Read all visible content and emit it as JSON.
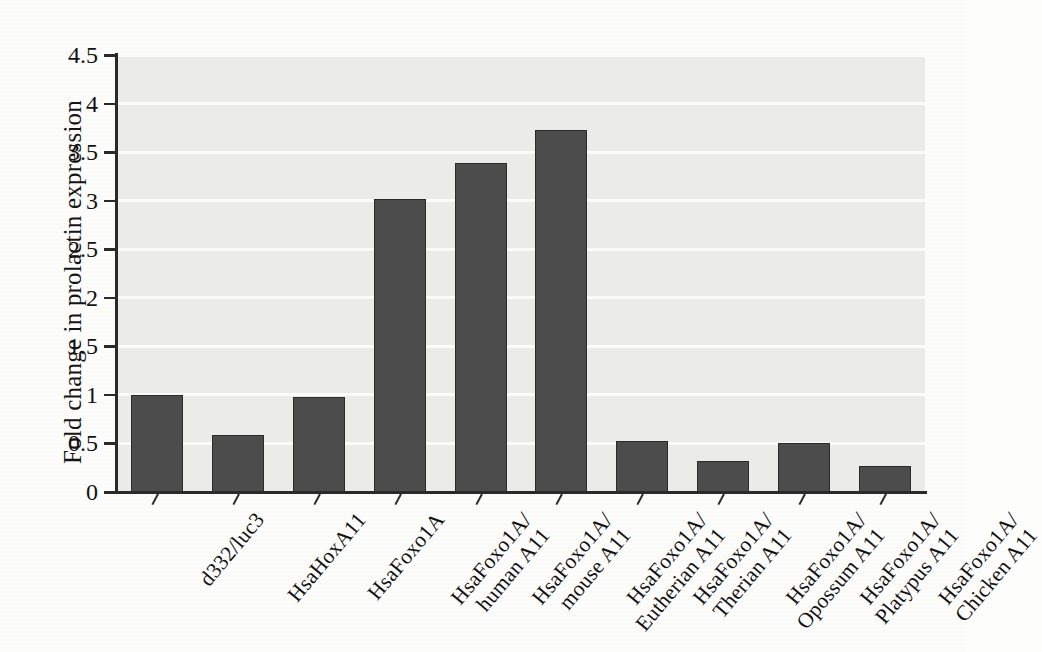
{
  "chart_data": {
    "type": "bar",
    "title": "",
    "xlabel": "",
    "ylabel": "Fold change in prolactin expression",
    "ylim": [
      0,
      4.5
    ],
    "ytick_labels": [
      "0",
      "0.5",
      "1",
      "1.5",
      "2",
      "2.5",
      "3",
      "3.5",
      "4",
      "4.5"
    ],
    "ytick_values": [
      0,
      0.5,
      1,
      1.5,
      2,
      2.5,
      3,
      3.5,
      4,
      4.5
    ],
    "grid": "horizontal",
    "legend": "none",
    "bar_color": "#4c4c4c",
    "bar_edge_color": "#2b2b2b",
    "plot_background": "#ebebea",
    "categories": [
      "d332/luc3",
      "HsaHoxA11",
      "HsaFoxo1A",
      "HsaFoxo1A/ human A11",
      "HsaFoxo1A/ mouse A11",
      "HsaFoxo1A/ Eutherian A11",
      "HsaFoxo1A/ Therian A11",
      "HsaFoxo1A/ Opossum A11",
      "HsaFoxo1A/ Platypus A11",
      "HsaFoxo1A/ Chicken A11"
    ],
    "category_lines": [
      [
        "d332/luc3",
        ""
      ],
      [
        "HsaHoxA11",
        ""
      ],
      [
        "HsaFoxo1A",
        ""
      ],
      [
        "HsaFoxo1A/",
        "human A11"
      ],
      [
        "HsaFoxo1A/",
        "mouse A11"
      ],
      [
        "HsaFoxo1A/",
        "Eutherian A11"
      ],
      [
        "HsaFoxo1A/",
        "Therian A11"
      ],
      [
        "HsaFoxo1A/",
        "Opossum A11"
      ],
      [
        "HsaFoxo1A/",
        "Platypus A11"
      ],
      [
        "HsaFoxo1A/",
        "Chicken A11"
      ]
    ],
    "values": [
      1.0,
      0.59,
      0.98,
      3.02,
      3.39,
      3.73,
      0.53,
      0.32,
      0.5,
      0.27
    ]
  }
}
